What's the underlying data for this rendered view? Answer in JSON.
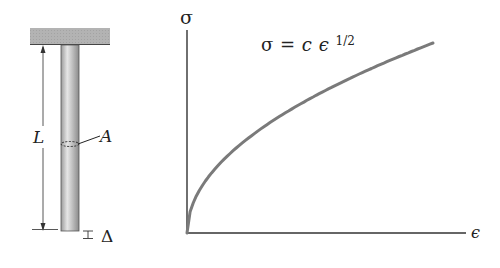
{
  "bar_figure": {
    "length_label": "L",
    "area_label": "A",
    "elongation_label": "Δ"
  },
  "graph": {
    "y_axis_label": "σ",
    "x_axis_label": "ϵ",
    "equation": {
      "lhs": "σ",
      "equals": "=",
      "coef": "c",
      "var": "ϵ",
      "exponent": "1/2"
    },
    "curve_color": "#7a7a7a",
    "axis_color": "#333333"
  },
  "chart_data": {
    "type": "line",
    "xlabel": "ϵ",
    "ylabel": "σ",
    "grid": false,
    "series": [
      {
        "name": "σ = c ϵ^(1/2)",
        "x": [
          0,
          0.05,
          0.1,
          0.2,
          0.3,
          0.4,
          0.5,
          0.6,
          0.7,
          0.8,
          0.9,
          1.0
        ],
        "y": [
          0,
          0.224,
          0.316,
          0.447,
          0.548,
          0.632,
          0.707,
          0.775,
          0.837,
          0.894,
          0.949,
          1.0
        ]
      }
    ]
  }
}
